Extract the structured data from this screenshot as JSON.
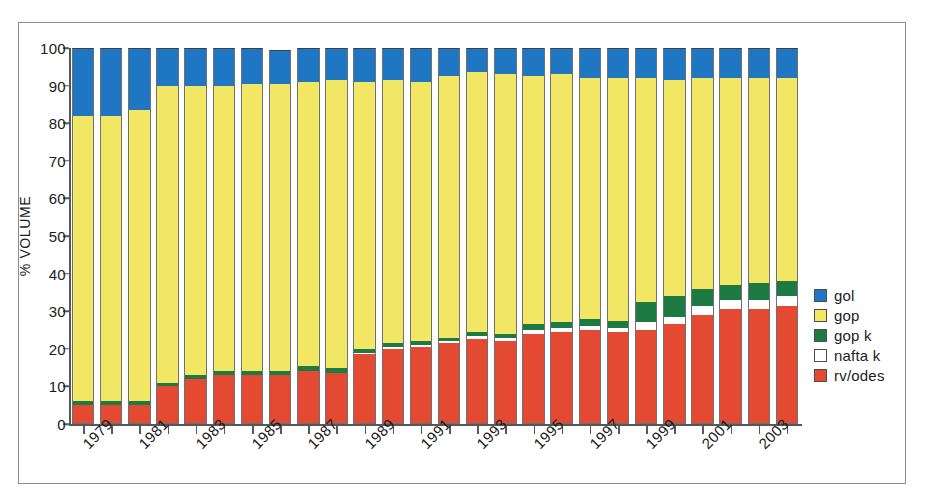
{
  "chart_data": {
    "type": "bar",
    "subtype": "stacked-percent",
    "title": "",
    "xlabel": "",
    "ylabel": "% VOLUME",
    "ylim": [
      0,
      100
    ],
    "yticks": [
      0,
      10,
      20,
      30,
      40,
      50,
      60,
      70,
      80,
      90,
      100
    ],
    "grid": false,
    "legend_position": "right",
    "categories": [
      "1979",
      "1980",
      "1981",
      "1982",
      "1983",
      "1984",
      "1985",
      "1986",
      "1987",
      "1988",
      "1989",
      "1990",
      "1991",
      "1992",
      "1993",
      "1994",
      "1995",
      "1996",
      "1997",
      "1998",
      "1999",
      "2000",
      "2001",
      "2002",
      "2003",
      "2004"
    ],
    "tick_labels": [
      "1979",
      "",
      "1981",
      "",
      "1983",
      "",
      "1985",
      "",
      "1987",
      "",
      "1989",
      "",
      "1991",
      "",
      "1993",
      "",
      "1995",
      "",
      "1997",
      "",
      "1999",
      "",
      "2001",
      "",
      "2003",
      ""
    ],
    "series": [
      {
        "name": "rv/odes",
        "color": "#e44a32",
        "values": [
          5,
          5,
          5,
          10,
          12,
          13,
          13,
          13,
          14,
          13.5,
          18.5,
          20,
          20.5,
          21.5,
          22.5,
          22,
          24,
          24.5,
          25,
          24.5,
          25,
          26.5,
          29,
          30.5,
          30.5,
          31.5
        ]
      },
      {
        "name": "nafta k",
        "color": "#ffffff",
        "values": [
          0,
          0,
          0,
          0,
          0,
          0,
          0,
          0,
          0,
          0,
          0.5,
          0.5,
          0.5,
          0.5,
          1,
          1,
          1,
          1,
          1,
          1,
          2,
          2,
          2.5,
          2.5,
          2.5,
          2.5
        ]
      },
      {
        "name": "gop k",
        "color": "#1d7a42",
        "values": [
          1,
          1,
          1,
          1,
          1,
          1,
          1,
          1,
          1.5,
          1.5,
          1,
          1,
          1,
          1,
          1,
          1,
          1.5,
          1.5,
          2,
          2,
          5.5,
          5.5,
          4.5,
          4,
          4.5,
          4
        ]
      },
      {
        "name": "gop",
        "color": "#f2e765",
        "values": [
          76,
          76,
          77.5,
          79,
          77,
          76,
          76.5,
          76.5,
          75.5,
          76.5,
          71,
          70,
          69,
          69.5,
          69,
          69,
          66,
          66,
          64,
          64.5,
          59.5,
          57.5,
          56,
          55,
          54.5,
          54
        ]
      },
      {
        "name": "gol",
        "color": "#1f77c4",
        "values": [
          18,
          18,
          16.5,
          10,
          10,
          10,
          9.5,
          9,
          9,
          8.5,
          9,
          8.5,
          9,
          7.5,
          6.5,
          7,
          7.5,
          7,
          8,
          8,
          8,
          8.5,
          8,
          8,
          8,
          8
        ]
      }
    ]
  },
  "legend": {
    "items": [
      {
        "label": "gol",
        "color": "#1f77c4"
      },
      {
        "label": "gop",
        "color": "#f2e765"
      },
      {
        "label": "gop k",
        "color": "#1d7a42"
      },
      {
        "label": "nafta k",
        "color": "#ffffff"
      },
      {
        "label": "rv/odes",
        "color": "#e44a32"
      }
    ]
  },
  "axis": {
    "y_title": "% VOLUME"
  }
}
